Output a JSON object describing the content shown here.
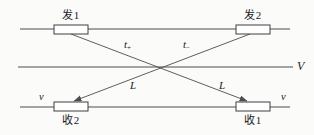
{
  "diagram": {
    "nodes": {
      "transmitter1": {
        "label": "发1"
      },
      "transmitter2": {
        "label": "发2"
      },
      "receiver2": {
        "label": "收2"
      },
      "receiver1": {
        "label": "收1"
      }
    },
    "labels": {
      "time_left_base": "t",
      "time_left_sub": "+",
      "time_right_base": "t",
      "time_right_sub": "−",
      "length_left": "L",
      "length_right": "L",
      "flow_velocity": "V",
      "speed_left": "v",
      "speed_right": "v"
    },
    "colors": {
      "line": "#4d4d4d",
      "background": "#fbfbfa",
      "box_fill": "#ffffff",
      "box_border": "#3f3f3f",
      "text": "#1a1a1a"
    }
  }
}
